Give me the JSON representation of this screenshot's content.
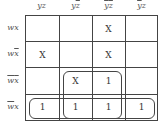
{
  "kmap": {
    "columns": [
      {
        "base": "yz",
        "overline_y": false,
        "overline_z": false
      },
      {
        "base": "yz",
        "overline_y": false,
        "overline_z": true
      },
      {
        "base": "yz",
        "overline_y": true,
        "overline_z": true
      },
      {
        "base": "yz",
        "overline_y": true,
        "overline_z": false
      }
    ],
    "col_labels": {
      "c0": {
        "a": "y",
        "b": "z"
      },
      "c1": {
        "a": "y",
        "b": "z"
      },
      "c2": {
        "a": "y",
        "b": "z"
      },
      "c3": {
        "a": "y",
        "b": "z"
      }
    },
    "row_labels": {
      "r0": {
        "a": "w",
        "b": "x"
      },
      "r1": {
        "a": "w",
        "b": "x"
      },
      "r2": {
        "a": "w",
        "b": "x"
      },
      "r3": {
        "a": "w",
        "b": "x"
      }
    },
    "cells": [
      [
        "",
        "",
        "X",
        ""
      ],
      [
        "X",
        "",
        "X",
        ""
      ],
      [
        "",
        "X",
        "1",
        ""
      ],
      [
        "1",
        "1",
        "1",
        "1"
      ]
    ],
    "groups": [
      {
        "name": "2x2 group",
        "rows": [
          2,
          3
        ],
        "cols": [
          1,
          2
        ]
      },
      {
        "name": "row group",
        "rows": [
          3
        ],
        "cols": [
          0,
          1,
          2,
          3
        ]
      }
    ]
  }
}
